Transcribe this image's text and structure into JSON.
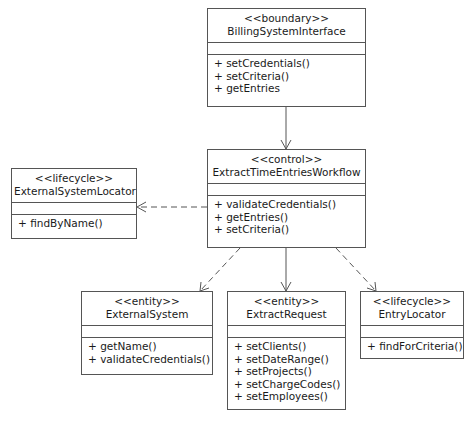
{
  "classes": {
    "billing": {
      "stereotype": "<<boundary>>",
      "name": "BillingSystemInterface",
      "ops": [
        "+ setCredentials()",
        "+ setCriteria()",
        "+ getEntries"
      ]
    },
    "workflow": {
      "stereotype": "<<control>>",
      "name": "ExtractTimeEntriesWorkflow",
      "ops": [
        "+ validateCredentials()",
        "+ getEntries()",
        "+ setCriteria()"
      ]
    },
    "locator": {
      "stereotype": "<<lifecycle>>",
      "name": "ExternalSystemLocator",
      "ops": [
        "+ findByName()"
      ]
    },
    "external": {
      "stereotype": "<<entity>>",
      "name": "ExternalSystem",
      "ops": [
        "+ getName()",
        "+ validateCredentials()"
      ]
    },
    "request": {
      "stereotype": "<<entity>>",
      "name": "ExtractRequest",
      "ops": [
        "+ setClients()",
        "+ setDateRange()",
        "+ setProjects()",
        "+ setChargeCodes()",
        "+ setEmployees()"
      ]
    },
    "entry": {
      "stereotype": "<<lifecycle>>",
      "name": "EntryLocator",
      "ops": [
        "+ findForCriteria()"
      ]
    }
  },
  "relations": [
    {
      "from": "BillingSystemInterface",
      "to": "ExtractTimeEntriesWorkflow",
      "style": "solid"
    },
    {
      "from": "ExtractTimeEntriesWorkflow",
      "to": "ExternalSystemLocator",
      "style": "dashed"
    },
    {
      "from": "ExtractTimeEntriesWorkflow",
      "to": "ExternalSystem",
      "style": "dashed"
    },
    {
      "from": "ExtractTimeEntriesWorkflow",
      "to": "ExtractRequest",
      "style": "solid"
    },
    {
      "from": "ExtractTimeEntriesWorkflow",
      "to": "EntryLocator",
      "style": "dashed"
    }
  ]
}
